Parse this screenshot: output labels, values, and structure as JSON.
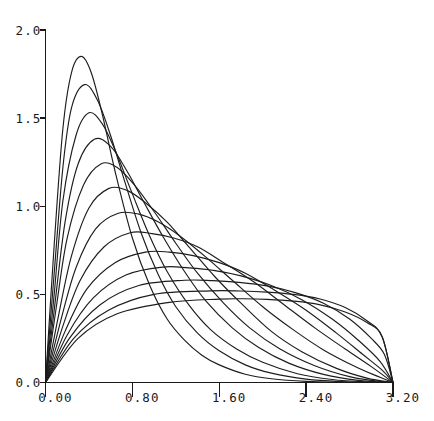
{
  "chart_data": {
    "type": "line",
    "title": "",
    "subtitle": "",
    "xlabel": "",
    "ylabel": "",
    "xlim": [
      0.0,
      3.2
    ],
    "ylim": [
      0.0,
      2.0
    ],
    "grid": false,
    "legend": "none",
    "xticks": [
      {
        "value": 0.0,
        "label": "0.00"
      },
      {
        "value": 0.8,
        "label": "0.80"
      },
      {
        "value": 1.6,
        "label": "1.60"
      },
      {
        "value": 2.4,
        "label": "2.40"
      },
      {
        "value": 3.2,
        "label": "3.20"
      }
    ],
    "yticks": [
      {
        "value": 0.0,
        "label": "0.0"
      },
      {
        "value": 0.5,
        "label": "0.5"
      },
      {
        "value": 1.0,
        "label": "1.0"
      },
      {
        "value": 1.5,
        "label": "1.5"
      },
      {
        "value": 2.0,
        "label": "2.0"
      }
    ],
    "series_count": 13,
    "series_color": "#1d1d1d",
    "series": [
      {
        "name": "curve-1",
        "peak_x": 0.33,
        "peak_y": 1.85,
        "x": [
          0.0,
          0.08,
          0.16,
          0.24,
          0.33,
          0.42,
          0.52,
          0.64,
          0.8,
          0.96,
          1.12,
          1.28,
          1.44,
          1.6,
          1.84,
          2.08,
          2.4,
          2.72,
          3.04,
          3.2
        ],
        "values": [
          0.0,
          0.78,
          1.44,
          1.76,
          1.85,
          1.76,
          1.53,
          1.2,
          0.82,
          0.55,
          0.36,
          0.24,
          0.155,
          0.1,
          0.047,
          0.021,
          0.006,
          0.0012,
          0.0001,
          0.0
        ]
      },
      {
        "name": "curve-2",
        "peak_x": 0.36,
        "peak_y": 1.69,
        "x": [
          0.0,
          0.08,
          0.16,
          0.24,
          0.36,
          0.48,
          0.6,
          0.72,
          0.88,
          1.04,
          1.2,
          1.4,
          1.6,
          1.84,
          2.08,
          2.4,
          2.72,
          3.04,
          3.2
        ],
        "values": [
          0.0,
          0.62,
          1.22,
          1.56,
          1.69,
          1.6,
          1.4,
          1.16,
          0.85,
          0.61,
          0.43,
          0.28,
          0.18,
          0.1,
          0.053,
          0.019,
          0.005,
          0.0004,
          0.0
        ]
      },
      {
        "name": "curve-3",
        "peak_x": 0.4,
        "peak_y": 1.53,
        "x": [
          0.0,
          0.08,
          0.16,
          0.28,
          0.4,
          0.52,
          0.64,
          0.8,
          0.96,
          1.12,
          1.32,
          1.52,
          1.76,
          2.0,
          2.32,
          2.64,
          2.96,
          3.2
        ],
        "values": [
          0.0,
          0.5,
          1.03,
          1.4,
          1.53,
          1.47,
          1.32,
          1.07,
          0.83,
          0.63,
          0.44,
          0.3,
          0.19,
          0.115,
          0.05,
          0.017,
          0.003,
          0.0
        ]
      },
      {
        "name": "curve-4",
        "peak_x": 0.45,
        "peak_y": 1.38,
        "x": [
          0.0,
          0.08,
          0.18,
          0.3,
          0.45,
          0.6,
          0.75,
          0.9,
          1.08,
          1.28,
          1.48,
          1.72,
          1.96,
          2.24,
          2.56,
          2.88,
          3.2
        ],
        "values": [
          0.0,
          0.41,
          0.91,
          1.24,
          1.38,
          1.34,
          1.2,
          1.03,
          0.83,
          0.63,
          0.46,
          0.31,
          0.2,
          0.11,
          0.046,
          0.012,
          0.0
        ]
      },
      {
        "name": "curve-5",
        "peak_x": 0.51,
        "peak_y": 1.24,
        "x": [
          0.0,
          0.1,
          0.2,
          0.35,
          0.51,
          0.66,
          0.82,
          1.0,
          1.2,
          1.4,
          1.64,
          1.88,
          2.16,
          2.48,
          2.8,
          3.04,
          3.2
        ],
        "values": [
          0.0,
          0.43,
          0.82,
          1.12,
          1.24,
          1.22,
          1.12,
          0.97,
          0.79,
          0.62,
          0.45,
          0.31,
          0.19,
          0.095,
          0.033,
          0.009,
          0.0
        ]
      },
      {
        "name": "curve-6",
        "peak_x": 0.58,
        "peak_y": 1.1,
        "x": [
          0.0,
          0.12,
          0.24,
          0.4,
          0.58,
          0.75,
          0.92,
          1.12,
          1.32,
          1.56,
          1.8,
          2.08,
          2.36,
          2.68,
          2.96,
          3.2
        ],
        "values": [
          0.0,
          0.38,
          0.72,
          0.99,
          1.1,
          1.09,
          1.02,
          0.91,
          0.77,
          0.6,
          0.45,
          0.29,
          0.175,
          0.08,
          0.025,
          0.0
        ]
      },
      {
        "name": "curve-7",
        "peak_x": 0.67,
        "peak_y": 0.96,
        "x": [
          0.0,
          0.14,
          0.28,
          0.46,
          0.67,
          0.86,
          1.04,
          1.24,
          1.48,
          1.72,
          2.0,
          2.28,
          2.56,
          2.88,
          3.08,
          3.2
        ],
        "values": [
          0.0,
          0.35,
          0.65,
          0.87,
          0.96,
          0.955,
          0.91,
          0.83,
          0.71,
          0.58,
          0.43,
          0.3,
          0.185,
          0.082,
          0.03,
          0.0
        ]
      },
      {
        "name": "curve-8",
        "peak_x": 0.78,
        "peak_y": 0.85,
        "x": [
          0.0,
          0.16,
          0.32,
          0.54,
          0.78,
          0.98,
          1.18,
          1.4,
          1.64,
          1.92,
          2.2,
          2.48,
          2.76,
          3.0,
          3.2
        ],
        "values": [
          0.0,
          0.32,
          0.58,
          0.77,
          0.85,
          0.845,
          0.82,
          0.77,
          0.68,
          0.57,
          0.44,
          0.31,
          0.19,
          0.09,
          0.0
        ]
      },
      {
        "name": "curve-9",
        "peak_x": 0.92,
        "peak_y": 0.74,
        "x": [
          0.0,
          0.18,
          0.38,
          0.64,
          0.92,
          1.14,
          1.36,
          1.6,
          1.84,
          2.12,
          2.4,
          2.68,
          2.92,
          3.1,
          3.2
        ],
        "values": [
          0.0,
          0.29,
          0.53,
          0.68,
          0.74,
          0.74,
          0.72,
          0.68,
          0.62,
          0.52,
          0.41,
          0.28,
          0.16,
          0.07,
          0.0
        ]
      },
      {
        "name": "curve-10",
        "peak_x": 1.08,
        "peak_y": 0.655,
        "x": [
          0.0,
          0.2,
          0.44,
          0.74,
          1.08,
          1.32,
          1.56,
          1.8,
          2.08,
          2.36,
          2.64,
          2.88,
          3.08,
          3.2
        ],
        "values": [
          0.0,
          0.27,
          0.48,
          0.61,
          0.655,
          0.65,
          0.635,
          0.605,
          0.55,
          0.47,
          0.36,
          0.24,
          0.12,
          0.0
        ]
      },
      {
        "name": "curve-11",
        "peak_x": 1.28,
        "peak_y": 0.58,
        "x": [
          0.0,
          0.22,
          0.5,
          0.86,
          1.28,
          1.54,
          1.78,
          2.04,
          2.3,
          2.56,
          2.8,
          3.0,
          3.12,
          3.2
        ],
        "values": [
          0.0,
          0.25,
          0.44,
          0.55,
          0.58,
          0.578,
          0.568,
          0.548,
          0.51,
          0.45,
          0.36,
          0.25,
          0.16,
          0.0
        ]
      },
      {
        "name": "curve-12",
        "peak_x": 1.52,
        "peak_y": 0.52,
        "x": [
          0.0,
          0.26,
          0.58,
          1.0,
          1.52,
          1.8,
          2.04,
          2.28,
          2.52,
          2.76,
          2.96,
          3.1,
          3.2
        ],
        "values": [
          0.0,
          0.25,
          0.41,
          0.5,
          0.52,
          0.519,
          0.513,
          0.5,
          0.475,
          0.425,
          0.35,
          0.26,
          0.0
        ]
      },
      {
        "name": "curve-13",
        "peak_x": 1.82,
        "peak_y": 0.475,
        "x": [
          0.0,
          0.3,
          0.66,
          1.14,
          1.6,
          1.82,
          2.04,
          2.28,
          2.52,
          2.76,
          2.96,
          3.1,
          3.2
        ],
        "values": [
          0.0,
          0.25,
          0.39,
          0.455,
          0.473,
          0.475,
          0.472,
          0.462,
          0.442,
          0.4,
          0.34,
          0.26,
          0.0
        ]
      }
    ]
  }
}
